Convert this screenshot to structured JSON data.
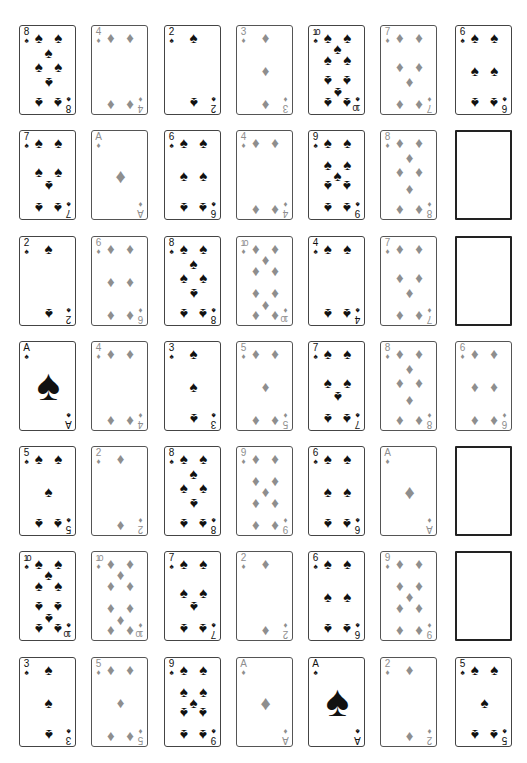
{
  "board": {
    "columns": 7,
    "rows": 7,
    "suit_colors": {
      "spades": "#111111",
      "diamonds": "#8e8e8e"
    },
    "grid": [
      [
        {
          "rank": "8",
          "suit": "spades"
        },
        {
          "rank": "4",
          "suit": "diamonds"
        },
        {
          "rank": "2",
          "suit": "spades"
        },
        {
          "rank": "3",
          "suit": "diamonds"
        },
        {
          "rank": "10",
          "suit": "spades"
        },
        {
          "rank": "7",
          "suit": "diamonds"
        },
        {
          "rank": "6",
          "suit": "spades"
        }
      ],
      [
        {
          "rank": "7",
          "suit": "spades"
        },
        {
          "rank": "A",
          "suit": "diamonds"
        },
        {
          "rank": "6",
          "suit": "spades"
        },
        {
          "rank": "4",
          "suit": "diamonds"
        },
        {
          "rank": "9",
          "suit": "spades"
        },
        {
          "rank": "8",
          "suit": "diamonds"
        },
        null
      ],
      [
        {
          "rank": "2",
          "suit": "spades"
        },
        {
          "rank": "6",
          "suit": "diamonds"
        },
        {
          "rank": "8",
          "suit": "spades"
        },
        {
          "rank": "10",
          "suit": "diamonds"
        },
        {
          "rank": "4",
          "suit": "spades"
        },
        {
          "rank": "7",
          "suit": "diamonds"
        },
        null
      ],
      [
        {
          "rank": "A",
          "suit": "spades"
        },
        {
          "rank": "4",
          "suit": "diamonds"
        },
        {
          "rank": "3",
          "suit": "spades"
        },
        {
          "rank": "5",
          "suit": "diamonds"
        },
        {
          "rank": "7",
          "suit": "spades"
        },
        {
          "rank": "8",
          "suit": "diamonds"
        },
        {
          "rank": "6",
          "suit": "diamonds"
        }
      ],
      [
        {
          "rank": "5",
          "suit": "spades"
        },
        {
          "rank": "2",
          "suit": "diamonds"
        },
        {
          "rank": "8",
          "suit": "spades"
        },
        {
          "rank": "9",
          "suit": "diamonds"
        },
        {
          "rank": "6",
          "suit": "spades"
        },
        {
          "rank": "A",
          "suit": "diamonds"
        },
        null
      ],
      [
        {
          "rank": "10",
          "suit": "spades"
        },
        {
          "rank": "10",
          "suit": "diamonds"
        },
        {
          "rank": "7",
          "suit": "spades"
        },
        {
          "rank": "2",
          "suit": "diamonds"
        },
        {
          "rank": "6",
          "suit": "spades"
        },
        {
          "rank": "9",
          "suit": "diamonds"
        },
        null
      ],
      [
        {
          "rank": "3",
          "suit": "spades"
        },
        {
          "rank": "5",
          "suit": "diamonds"
        },
        {
          "rank": "9",
          "suit": "spades"
        },
        {
          "rank": "A",
          "suit": "diamonds"
        },
        {
          "rank": "A",
          "suit": "spades"
        },
        {
          "rank": "2",
          "suit": "diamonds"
        },
        {
          "rank": "5",
          "suit": "spades"
        }
      ]
    ]
  }
}
